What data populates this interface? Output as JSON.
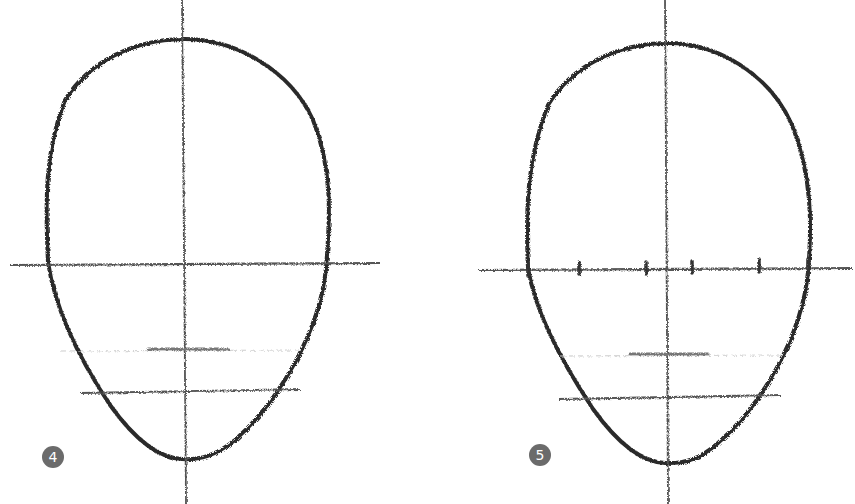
{
  "figures": [
    {
      "step_label": "4",
      "description": "Head oval with center line, eye line, nose and mouth guide lines"
    },
    {
      "step_label": "5",
      "description": "Head oval with eye line divided into five equal segments by tick marks"
    }
  ],
  "colors": {
    "stroke": "#2b2b2b",
    "guide": "#555555",
    "faint": "#bbbbbb",
    "badge": "#6b6b6b"
  }
}
